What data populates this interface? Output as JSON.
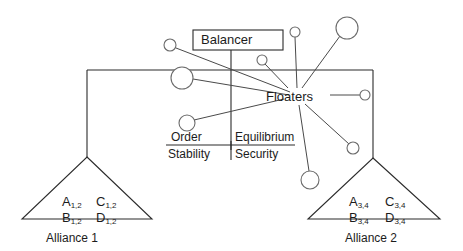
{
  "diagram": {
    "title_nodes": {
      "balancer": "Balancer",
      "floaters": "Floaters"
    },
    "functions": {
      "left_numerator": "Order",
      "left_denominator": "Stability",
      "right_numerator": "Equilibrium",
      "right_denominator": "Security"
    },
    "alliances": [
      {
        "caption": "Alliance 1",
        "members": [
          {
            "letter": "A",
            "subscript": "1,2"
          },
          {
            "letter": "C",
            "subscript": "1,2"
          },
          {
            "letter": "B",
            "subscript": "1,2"
          },
          {
            "letter": "D",
            "subscript": "1,2"
          }
        ]
      },
      {
        "caption": "Alliance 2",
        "members": [
          {
            "letter": "A",
            "subscript": "3,4"
          },
          {
            "letter": "C",
            "subscript": "3,4"
          },
          {
            "letter": "B",
            "subscript": "3,4"
          },
          {
            "letter": "D",
            "subscript": "3,4"
          }
        ]
      }
    ],
    "floater_nodes": [
      {
        "id": "floater-top-left-small",
        "cx": 170,
        "cy": 45,
        "r": 6
      },
      {
        "id": "floater-left-large",
        "cx": 182,
        "cy": 78,
        "r": 11
      },
      {
        "id": "floater-order-small",
        "cx": 187,
        "cy": 123,
        "r": 8
      },
      {
        "id": "floater-mid-small",
        "cx": 262,
        "cy": 60,
        "r": 5
      },
      {
        "id": "floater-top-stem-small",
        "cx": 295,
        "cy": 32,
        "r": 5
      },
      {
        "id": "floater-top-right-large",
        "cx": 347,
        "cy": 28,
        "r": 11
      },
      {
        "id": "floater-right-small",
        "cx": 365,
        "cy": 95,
        "r": 5
      },
      {
        "id": "floater-lower-right-small",
        "cx": 353,
        "cy": 148,
        "r": 6
      },
      {
        "id": "floater-bottom-large",
        "cx": 310,
        "cy": 180,
        "r": 9
      }
    ],
    "colors": {
      "line": "#4a4a4a",
      "line_dark": "#2b2b2b",
      "node_stroke": "#6b6b6b",
      "text": "#1c1c1c",
      "background": "#ffffff"
    }
  }
}
